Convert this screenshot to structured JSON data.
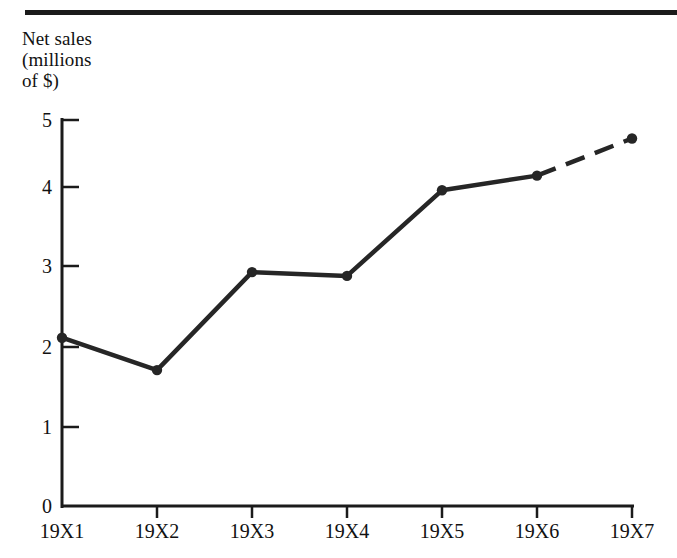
{
  "figure": {
    "title_lines": "Net sales\n(millions\nof $)",
    "rule_color": "#1b1b1b",
    "line_color": "#262626",
    "background": "#ffffff"
  },
  "chart_data": {
    "type": "line",
    "title": "Net sales (millions of $)",
    "xlabel": "",
    "ylabel": "Net sales (millions of $)",
    "categories": [
      "19X1",
      "19X2",
      "19X3",
      "19X4",
      "19X5",
      "19X6",
      "19X7"
    ],
    "values": [
      2.18,
      1.76,
      3.03,
      2.98,
      4.09,
      4.28,
      4.76
    ],
    "series": [
      {
        "name": "Net sales",
        "values": [
          2.18,
          1.76,
          3.03,
          2.98,
          4.09,
          4.28,
          4.76
        ]
      }
    ],
    "ylim": [
      0,
      5
    ],
    "yticks": [
      0,
      1,
      2,
      3,
      4,
      5
    ],
    "ytick_labels": [
      "0",
      "1",
      "2",
      "3",
      "4",
      "5"
    ],
    "xtick_labels": [
      "19X1",
      "19X2",
      "19X3",
      "19X4",
      "19X5",
      "19X6",
      "19X7"
    ],
    "grid": false,
    "legend": false,
    "markers": "filled-circle",
    "dashed_segments": [
      {
        "from": "19X6",
        "to": "19X7",
        "note": "projected"
      }
    ]
  },
  "yticks": [
    {
      "label": "5",
      "value": 5
    },
    {
      "label": "4",
      "value": 4
    },
    {
      "label": "3",
      "value": 3
    },
    {
      "label": "2",
      "value": 2
    },
    {
      "label": "1",
      "value": 1
    },
    {
      "label": "0",
      "value": 0
    }
  ],
  "xticks": [
    {
      "label": "19X1"
    },
    {
      "label": "19X2"
    },
    {
      "label": "19X3"
    },
    {
      "label": "19X4"
    },
    {
      "label": "19X5"
    },
    {
      "label": "19X6"
    },
    {
      "label": "19X7"
    }
  ]
}
